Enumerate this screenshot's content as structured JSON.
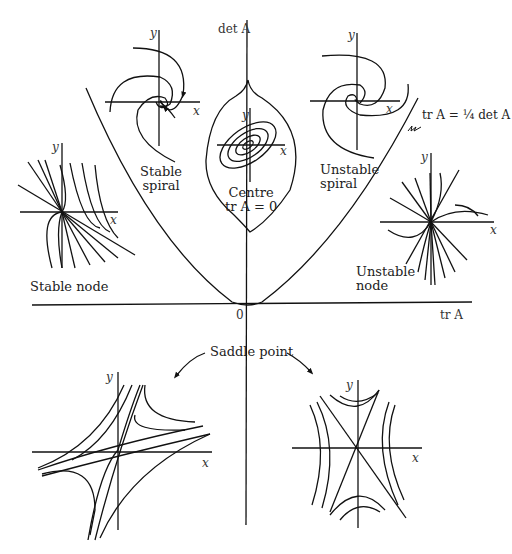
{
  "diagram": {
    "type": "trace-determinant plane with phase portraits",
    "axes": {
      "horizontal_label": "tr A",
      "vertical_label": "det A",
      "origin_label": "0"
    },
    "curve_label": "tr A = ¼ det A",
    "regions": [
      {
        "name": "stable-spiral",
        "label_line1": "Stable",
        "label_line2": "spiral"
      },
      {
        "name": "unstable-spiral",
        "label_line1": "Unstable",
        "label_line2": "spiral"
      },
      {
        "name": "centre",
        "label_line1": "Centre",
        "label_line2": "tr A = 0"
      },
      {
        "name": "stable-node",
        "label_line1": "Stable node"
      },
      {
        "name": "unstable-node",
        "label_line1": "Unstable",
        "label_line2": "node"
      },
      {
        "name": "saddle-point",
        "label_line1": "Saddle point"
      }
    ],
    "portrait_axis_labels": {
      "x": "x",
      "y": "y"
    }
  }
}
